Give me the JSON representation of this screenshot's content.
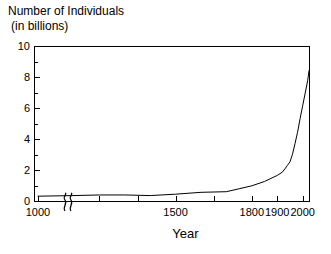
{
  "chart_data": {
    "type": "line",
    "title": "Number of Individuals (in billions)",
    "title_line1": "Number of Individuals",
    "title_line2": "(in billions)",
    "xlabel": "Year",
    "ylabel": "Number of Individuals (in billions)",
    "xlim": [
      1000,
      2025
    ],
    "ylim": [
      0,
      10
    ],
    "grid": false,
    "legend": false,
    "axis_break": {
      "present": true,
      "symbol": "double-squiggle",
      "after_value": 1000,
      "note": "x-axis broken just after 1000"
    },
    "y_ticks_major": [
      0,
      2,
      4,
      6,
      8,
      10
    ],
    "y_ticks_minor": [
      1,
      3,
      5,
      7,
      9
    ],
    "y_tick_labels": [
      "0",
      "2",
      "4",
      "6",
      "8",
      "10"
    ],
    "x_ticks_major": [
      1000,
      1200,
      1350,
      1500,
      1650,
      1800,
      1900,
      2000
    ],
    "x_tick_labels_shown": [
      "1000",
      "1500",
      "1800",
      "1900",
      "2000"
    ],
    "series": [
      {
        "name": "Human population",
        "x": [
          1000,
          1100,
          1200,
          1300,
          1400,
          1500,
          1600,
          1700,
          1750,
          1800,
          1850,
          1900,
          1920,
          1930,
          1940,
          1950,
          1960,
          1970,
          1980,
          1990,
          2000,
          2010,
          2020,
          2025
        ],
        "values": [
          0.31,
          0.35,
          0.39,
          0.39,
          0.35,
          0.44,
          0.56,
          0.6,
          0.79,
          0.98,
          1.26,
          1.65,
          1.86,
          2.07,
          2.3,
          2.52,
          3.02,
          3.7,
          4.44,
          5.32,
          6.14,
          6.96,
          7.79,
          8.4
        ]
      }
    ],
    "annotations": [
      {
        "text": "curve rises steeply after 1800",
        "visible": false
      }
    ]
  },
  "axes": {
    "y_title_line1": "Number of Individuals",
    "y_title_line2": "(in billions)",
    "x_title": "Year",
    "y_labels": [
      {
        "value": 10,
        "text": "10"
      },
      {
        "value": 8,
        "text": "8"
      },
      {
        "value": 6,
        "text": "6"
      },
      {
        "value": 4,
        "text": "4"
      },
      {
        "value": 2,
        "text": "2"
      },
      {
        "value": 0,
        "text": "0"
      }
    ],
    "x_labels": [
      {
        "value": 1000,
        "text": "1000"
      },
      {
        "value": 1500,
        "text": "1500"
      },
      {
        "value": 1800,
        "text": "1800"
      },
      {
        "value": 1900,
        "text": "1900"
      },
      {
        "value": 2000,
        "text": "2000"
      }
    ]
  },
  "colors": {
    "background": "#ffffff",
    "axis": "#000000",
    "curve": "#000000",
    "text": "#000000"
  }
}
